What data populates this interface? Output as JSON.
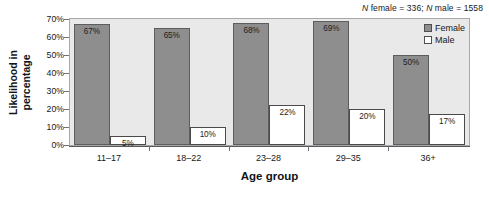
{
  "chart_data": {
    "type": "bar",
    "title": "",
    "annotation": "N female = 336; N male = 1558",
    "annotation_parts": {
      "n1_symbol": "N",
      "n1_text": " female = 336; ",
      "n2_symbol": "N",
      "n2_text": " male = 1558"
    },
    "categories": [
      "11–17",
      "18–22",
      "23–28",
      "29–35",
      "36+"
    ],
    "series": [
      {
        "name": "Female",
        "values": [
          67,
          65,
          68,
          69,
          50
        ],
        "labels": [
          "67%",
          "65%",
          "68%",
          "69%",
          "50%"
        ],
        "color": "#8e8e8e"
      },
      {
        "name": "Male",
        "values": [
          5,
          10,
          22,
          20,
          17
        ],
        "labels": [
          "5%",
          "10%",
          "22%",
          "20%",
          "17%"
        ],
        "color": "#ffffff"
      }
    ],
    "xlabel": "Age group",
    "ylabel": "Likelihood in percentage",
    "ylabel_lines": [
      "Likelihood in",
      "percentage"
    ],
    "ylim": [
      0,
      70
    ],
    "ytick_values": [
      0,
      10,
      20,
      30,
      40,
      50,
      60,
      70
    ],
    "ytick_labels": [
      "0%",
      "10%",
      "20%",
      "30%",
      "40%",
      "50%",
      "60%",
      "70%"
    ],
    "grid": false,
    "legend_position": "top-right",
    "legend": [
      "Female",
      "Male"
    ]
  }
}
